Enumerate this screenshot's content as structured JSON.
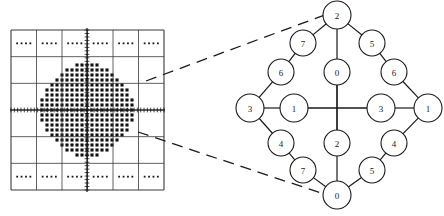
{
  "figure": {
    "title": "",
    "left_panel": {
      "name": "coarse-grid-with-dot-cluster",
      "grid": {
        "cols": 6,
        "rows": 6,
        "x": 11,
        "y": 30,
        "width": 153,
        "height": 160
      },
      "axes": {
        "horizontal_y": 110,
        "vertical_x": 87,
        "tick_count_h": 46,
        "tick_count_v": 46,
        "label_h": "",
        "label_v": ""
      },
      "sparse_cell_dots": 4,
      "cluster": {
        "center_x": 87,
        "center_y": 110,
        "radius": 47,
        "spacing": 5.0
      }
    },
    "right_panel": {
      "name": "expanded-lattice-detail",
      "center": {
        "x": 337,
        "y": 108
      },
      "nodes": [
        {
          "id": "top",
          "label": "2",
          "x": 337,
          "y": 15,
          "r": 14
        },
        {
          "id": "up-left-7",
          "label": "7",
          "x": 303,
          "y": 43,
          "r": 13
        },
        {
          "id": "up-right-5",
          "label": "5",
          "x": 372,
          "y": 43,
          "r": 13
        },
        {
          "id": "up-left-6",
          "label": "6",
          "x": 281,
          "y": 72,
          "r": 13
        },
        {
          "id": "up-mid-0",
          "label": "0",
          "x": 337,
          "y": 72,
          "r": 13
        },
        {
          "id": "up-right-6",
          "label": "6",
          "x": 394,
          "y": 72,
          "r": 13
        },
        {
          "id": "left-3",
          "label": "3",
          "x": 250,
          "y": 108,
          "r": 14
        },
        {
          "id": "mid-left-1",
          "label": "1",
          "x": 294,
          "y": 108,
          "r": 14
        },
        {
          "id": "mid-right-3",
          "label": "3",
          "x": 381,
          "y": 108,
          "r": 14
        },
        {
          "id": "right-1",
          "label": "1",
          "x": 428,
          "y": 108,
          "r": 14
        },
        {
          "id": "lo-left-4",
          "label": "4",
          "x": 281,
          "y": 143,
          "r": 13
        },
        {
          "id": "lo-mid-2",
          "label": "2",
          "x": 337,
          "y": 143,
          "r": 13
        },
        {
          "id": "lo-right-4",
          "label": "4",
          "x": 394,
          "y": 143,
          "r": 13
        },
        {
          "id": "lo-left-7",
          "label": "7",
          "x": 303,
          "y": 170,
          "r": 13
        },
        {
          "id": "lo-right-5",
          "label": "5",
          "x": 372,
          "y": 170,
          "r": 13
        },
        {
          "id": "bottom",
          "label": "0",
          "x": 337,
          "y": 195,
          "r": 14
        }
      ],
      "edges": [
        [
          "top",
          "up-left-7"
        ],
        [
          "up-left-7",
          "up-left-6"
        ],
        [
          "up-left-6",
          "left-3"
        ],
        [
          "top",
          "up-right-5"
        ],
        [
          "up-right-5",
          "up-right-6"
        ],
        [
          "up-right-6",
          "right-1"
        ],
        [
          "left-3",
          "lo-left-4"
        ],
        [
          "lo-left-4",
          "lo-left-7"
        ],
        [
          "lo-left-7",
          "bottom"
        ],
        [
          "right-1",
          "lo-right-4"
        ],
        [
          "lo-right-4",
          "lo-right-5"
        ],
        [
          "lo-right-5",
          "bottom"
        ],
        [
          "left-3",
          "mid-left-1"
        ],
        [
          "mid-left-1",
          "mid-right-3"
        ],
        [
          "mid-right-3",
          "right-1"
        ],
        [
          "top",
          "up-mid-0"
        ],
        [
          "up-mid-0",
          "lo-mid-2"
        ],
        [
          "lo-mid-2",
          "bottom"
        ]
      ]
    },
    "callout_lines": [
      {
        "name": "upper-callout",
        "x1": 146,
        "y1": 81,
        "x2": 330,
        "y2": 13
      },
      {
        "name": "lower-callout",
        "x1": 138,
        "y1": 132,
        "x2": 330,
        "y2": 196
      }
    ]
  }
}
